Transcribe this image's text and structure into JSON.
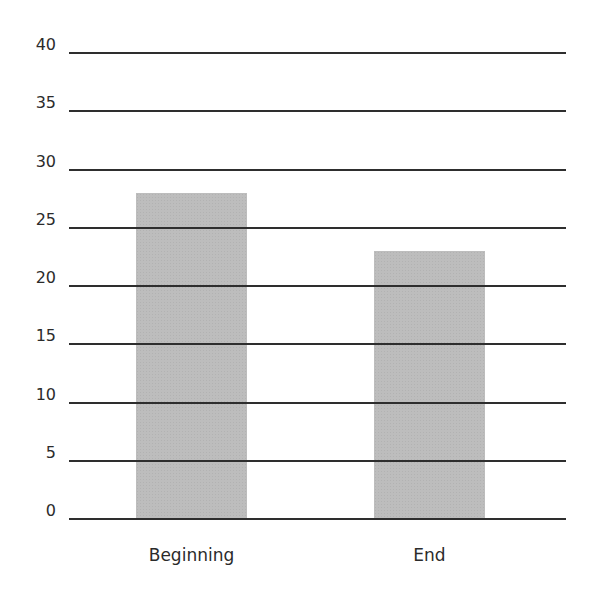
{
  "chart_data": {
    "type": "bar",
    "title": "",
    "xlabel": "",
    "ylabel": "",
    "categories": [
      "Beginning",
      "End"
    ],
    "values": [
      28,
      23
    ],
    "ylim": [
      0,
      40
    ],
    "yticks": [
      0,
      5,
      10,
      15,
      20,
      25,
      30,
      35,
      40
    ],
    "grid": true,
    "legend": null,
    "bar_color": "#bdbdbd",
    "grid_color": "#2e2e2e"
  }
}
